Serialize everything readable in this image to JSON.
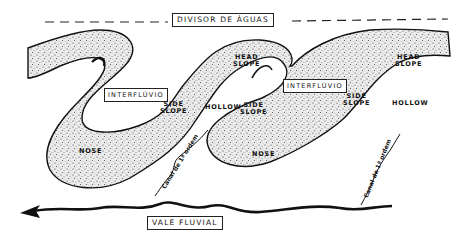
{
  "diagram": {
    "top_label": "DIVISOR DE ÁGUAS",
    "bottom_label": "VALE FLUVIAL",
    "interfluvio_labels": [
      "INTERFLÚVIO",
      "INTERFLÚVIO"
    ],
    "head_slope_labels": [
      {
        "line1": "HEAD",
        "line2": "SLOPE"
      },
      {
        "line1": "HEAD",
        "line2": "SLOPE"
      }
    ],
    "side_slope_labels": [
      {
        "line1": "SIDE",
        "line2": "SLOPE"
      },
      {
        "line1": "SIDE",
        "line2": "SLOPE"
      },
      {
        "line1": "SIDE",
        "line2": "SLOPE"
      }
    ],
    "hollow_labels": [
      "HOLLOW",
      "HOLLOW"
    ],
    "nose_labels": [
      "NOSE",
      "NOSE"
    ],
    "canal_labels": [
      "Canal de 1ª ordem",
      "Canal de 1ª ordem"
    ],
    "colors": {
      "ink": "#111111",
      "stipple_fill": "#e6e6e6",
      "background": "#ffffff"
    }
  }
}
